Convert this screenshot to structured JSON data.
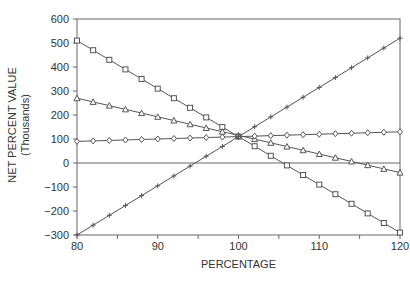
{
  "chart_data": {
    "type": "line",
    "title": "",
    "xlabel": "PERCENTAGE",
    "ylabel": "NET PERCENT VALUE",
    "ylabel_sub": "(Thousands)",
    "xlim": [
      80,
      120
    ],
    "ylim": [
      -300,
      600
    ],
    "x_ticks": [
      80,
      90,
      100,
      110,
      120
    ],
    "y_ticks": [
      600,
      500,
      400,
      300,
      200,
      100,
      0,
      -100,
      -200,
      -300
    ],
    "grid": false,
    "zero_line": true,
    "legend": null,
    "x": [
      80,
      82,
      84,
      86,
      88,
      90,
      92,
      94,
      96,
      98,
      100,
      102,
      104,
      106,
      108,
      110,
      112,
      114,
      116,
      118,
      120
    ],
    "series": [
      {
        "name": "square",
        "marker": "square",
        "start": 510,
        "end": -290
      },
      {
        "name": "triangle",
        "marker": "triangle",
        "start": 270,
        "end": -40
      },
      {
        "name": "diamond",
        "marker": "diamond",
        "start": 90,
        "end": 130
      },
      {
        "name": "plus",
        "marker": "plus",
        "start": -300,
        "end": 520
      }
    ],
    "intersection": {
      "x": 100,
      "y": 110
    }
  },
  "colors": {
    "line": "#555555",
    "axis": "#666666",
    "text": "#333333"
  }
}
